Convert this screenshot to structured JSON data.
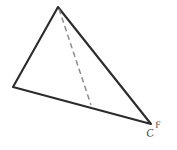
{
  "figure": {
    "background_color": "#ffffff",
    "width": 177,
    "height": 150,
    "stroke_color_solid": "#2b2b2b",
    "stroke_color_hidden": "#8d8d8d",
    "labels": {
      "vertex_c": "C",
      "vertex_f": "F"
    },
    "vertices": {
      "apex": {
        "name": "apex",
        "x": 58,
        "y": 7
      },
      "left": {
        "name": "left",
        "x": 13,
        "y": 87
      },
      "bottom_right": {
        "name": "bottom-right",
        "x": 151,
        "y": 124
      },
      "hidden_base": {
        "name": "hidden-base",
        "x": 91,
        "y": 105
      }
    },
    "edges": [
      {
        "name": "edge-apex-left",
        "style": "solid",
        "from": "apex",
        "to": "left"
      },
      {
        "name": "edge-apex-bottom-right",
        "style": "solid",
        "from": "apex",
        "to": "bottom_right"
      },
      {
        "name": "edge-left-bottom-right",
        "style": "solid",
        "from": "left",
        "to": "bottom_right"
      },
      {
        "name": "edge-apex-hidden-base",
        "style": "dashed",
        "from": "apex",
        "to": "hidden_base"
      }
    ],
    "paths": {
      "outline": "M 58 7 L 13 87 L 151 124 Z",
      "hidden": "M 59 9 L 91 105"
    }
  }
}
